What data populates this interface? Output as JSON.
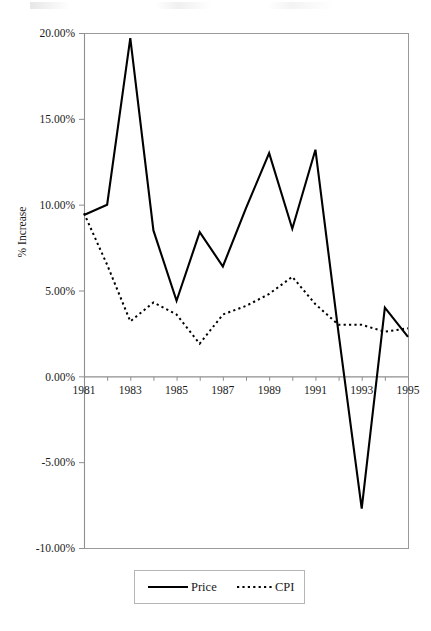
{
  "figure": {
    "name": "price-vs-cpi-line-chart"
  },
  "axes": {
    "ylabel": "% Increase",
    "ytick_labels": [
      "20.00%",
      "15.00%",
      "10.00%",
      "5.00%",
      "0.00%",
      "-5.00%",
      "-10.00%"
    ],
    "xtick_labels": [
      "1981",
      "1983",
      "1985",
      "1987",
      "1989",
      "1991",
      "1993",
      "1995"
    ]
  },
  "legend": {
    "entries": [
      {
        "label": "Price",
        "style": "solid"
      },
      {
        "label": "CPI",
        "style": "dotted"
      }
    ]
  },
  "colors": {
    "series": "#000000",
    "axis": "#8f8f8f",
    "frame": "#9a9a9a",
    "text": "#1a1a1a",
    "background": "#ffffff"
  },
  "chart_data": {
    "type": "line",
    "title": "",
    "subtitle": "",
    "xlabel": "",
    "ylabel": "% Increase",
    "x": [
      1981,
      1982,
      1983,
      1984,
      1985,
      1986,
      1987,
      1988,
      1989,
      1990,
      1991,
      1992,
      1993,
      1994,
      1995
    ],
    "xlim": [
      1981,
      1995
    ],
    "ylim": [
      -10,
      20
    ],
    "ytick_values": [
      20,
      15,
      10,
      5,
      0,
      -5,
      -10
    ],
    "xtick_values": [
      1981,
      1983,
      1985,
      1987,
      1989,
      1991,
      1993,
      1995
    ],
    "y_unit": "percent",
    "grid": false,
    "legend_position": "bottom",
    "series": [
      {
        "name": "Price",
        "style": "solid",
        "values": [
          9.4,
          10.0,
          19.7,
          8.5,
          4.4,
          8.4,
          6.4,
          9.8,
          13.0,
          8.6,
          13.2,
          2.5,
          -7.7,
          4.0,
          2.3
        ]
      },
      {
        "name": "CPI",
        "style": "dotted",
        "values": [
          9.5,
          6.5,
          3.2,
          4.3,
          3.6,
          1.9,
          3.6,
          4.1,
          4.8,
          5.8,
          4.2,
          3.0,
          3.0,
          2.6,
          2.8
        ]
      }
    ]
  }
}
